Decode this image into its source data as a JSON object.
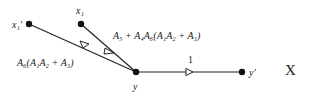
{
  "diagram": {
    "type": "signal-flow-graph",
    "nodes": [
      {
        "id": "x1p",
        "label": "x₁′",
        "x": 29,
        "y": 24
      },
      {
        "id": "x1",
        "label": "x₁",
        "x": 81,
        "y": 24
      },
      {
        "id": "y",
        "label": "y",
        "x": 136,
        "y": 72
      },
      {
        "id": "yp",
        "label": "y′",
        "x": 242,
        "y": 72
      }
    ],
    "edges": [
      {
        "from": "x1p",
        "to": "y",
        "gain": "A₆(A₁A₂ + A₃)"
      },
      {
        "from": "x1",
        "to": "y",
        "gain": "A₅ + A₄A₆(A₁A₂ + A₃)"
      },
      {
        "from": "y",
        "to": "yp",
        "gain": "1"
      }
    ],
    "marker": "X"
  }
}
